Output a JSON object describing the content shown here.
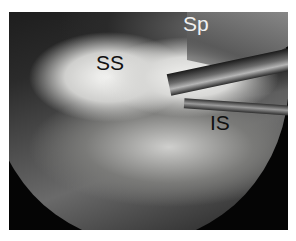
{
  "image": {
    "description": "Arthroscopic view of shoulder rotator cuff within circular scope field on black background",
    "labels": {
      "supraspinatus": "SS",
      "spine": "Sp",
      "infraspinatus": "IS"
    }
  }
}
